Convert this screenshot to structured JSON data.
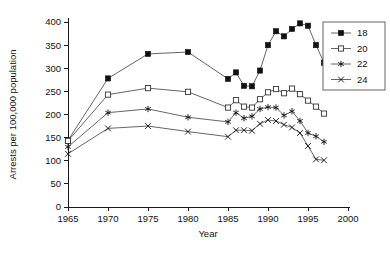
{
  "chart_data": {
    "type": "line",
    "title": "",
    "xlabel": "Year",
    "ylabel": "Arrests per 100,000 population",
    "xlim": [
      1965,
      2000
    ],
    "ylim": [
      0,
      400
    ],
    "xticks": [
      1965,
      1970,
      1975,
      1980,
      1985,
      1990,
      1995,
      2000
    ],
    "xtick_labels": [
      "1965",
      "1970",
      "1975",
      "1980",
      "1985",
      "1990",
      "1995",
      "2000"
    ],
    "yticks": [
      0,
      50,
      100,
      150,
      200,
      250,
      300,
      350,
      400
    ],
    "ytick_labels": [
      "0",
      "50",
      "100",
      "150",
      "200",
      "250",
      "300",
      "350",
      "400"
    ],
    "grid": false,
    "legend_position": "upper right",
    "legend_title": "",
    "series": [
      {
        "name": "18",
        "marker": "filled-square",
        "x": [
          1965,
          1970,
          1975,
          1980,
          1985,
          1986,
          1987,
          1988,
          1989,
          1990,
          1991,
          1992,
          1993,
          1994,
          1995,
          1996,
          1997
        ],
        "values": [
          144,
          278,
          331,
          335,
          277,
          291,
          262,
          261,
          295,
          350,
          380,
          369,
          385,
          397,
          392,
          350,
          312
        ]
      },
      {
        "name": "20",
        "marker": "open-square",
        "x": [
          1965,
          1970,
          1975,
          1980,
          1985,
          1986,
          1987,
          1988,
          1989,
          1990,
          1991,
          1992,
          1993,
          1994,
          1995,
          1996,
          1997
        ],
        "values": [
          143,
          243,
          257,
          249,
          215,
          231,
          217,
          215,
          233,
          248,
          255,
          246,
          256,
          244,
          230,
          217,
          202
        ]
      },
      {
        "name": "22",
        "marker": "star",
        "x": [
          1965,
          1970,
          1975,
          1980,
          1985,
          1986,
          1987,
          1988,
          1989,
          1990,
          1991,
          1992,
          1993,
          1994,
          1995,
          1996,
          1997
        ],
        "values": [
          130,
          204,
          212,
          194,
          184,
          204,
          192,
          196,
          212,
          216,
          215,
          198,
          207,
          186,
          160,
          153,
          141
        ]
      },
      {
        "name": "24",
        "marker": "x",
        "x": [
          1965,
          1970,
          1975,
          1980,
          1985,
          1986,
          1987,
          1988,
          1989,
          1990,
          1991,
          1992,
          1993,
          1994,
          1995,
          1996,
          1997
        ],
        "values": [
          115,
          170,
          175,
          163,
          152,
          166,
          166,
          165,
          180,
          188,
          186,
          178,
          172,
          160,
          132,
          103,
          101
        ]
      }
    ]
  },
  "legend": {
    "items": [
      {
        "label": "18"
      },
      {
        "label": "20"
      },
      {
        "label": "22"
      },
      {
        "label": "24"
      }
    ]
  },
  "colors": {
    "axis": "#1a1a1a",
    "line": "#555555",
    "marker": "#111111",
    "background": "#ffffff"
  }
}
